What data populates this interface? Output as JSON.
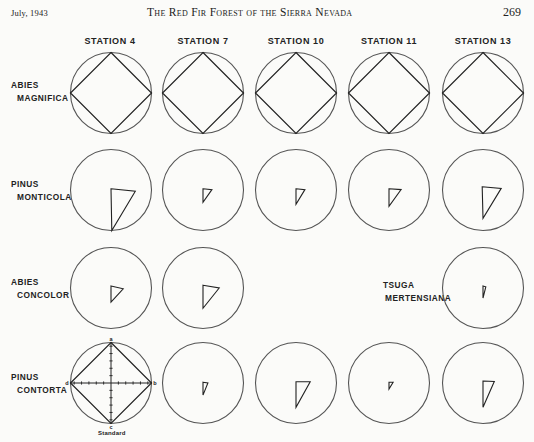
{
  "running_head": {
    "date": "July, 1943",
    "title": "The Red Fir Forest of the Sierra Nevada",
    "page_number": "269"
  },
  "figure": {
    "stations": [
      "STATION 4",
      "STATION 7",
      "STATION 10",
      "STATION 11",
      "STATION 13"
    ],
    "species": [
      {
        "line1": "ABIES",
        "line2": "MAGNIFICA"
      },
      {
        "line1": "PINUS",
        "line2": "MONTICOLA"
      },
      {
        "line1": "ABIES",
        "line2": "CONCOLOR"
      },
      {
        "line1": "PINUS",
        "line2": "CONTORTA"
      }
    ],
    "inline_species": {
      "line1": "TSUGA",
      "line2": "MERTENSIANA"
    },
    "standard_caption": "Standard",
    "axis_labels": {
      "a": "a",
      "b": "b",
      "c": "c",
      "d": "d"
    }
  },
  "chart_data": {
    "type": "polar-diagram-grid",
    "rows": [
      "Abies magnifica",
      "Pinus monticola",
      "Abies concolor",
      "Pinus contorta"
    ],
    "columns": [
      "Station 4",
      "Station 7",
      "Station 10",
      "Station 11",
      "Station 13"
    ],
    "cells": [
      [
        {
          "a": 1.0,
          "b": 1.0,
          "c": 1.0,
          "d": 1.0
        },
        {
          "a": 1.0,
          "b": 1.0,
          "c": 1.0,
          "d": 1.0
        },
        {
          "a": 1.0,
          "b": 1.0,
          "c": 1.0,
          "d": 1.0
        },
        {
          "a": 1.0,
          "b": 1.0,
          "c": 1.0,
          "d": 1.0
        },
        {
          "a": 1.0,
          "b": 1.0,
          "c": 1.0,
          "d": 1.0
        }
      ],
      [
        {
          "a": 0.02,
          "b": 0.6,
          "c": 1.0,
          "d": 0.0,
          "shape": [
            [
              0.0,
              -0.03
            ],
            [
              0.6,
              0.03
            ],
            [
              0.02,
              1.0
            ]
          ]
        },
        {
          "a": 0.0,
          "b": 0.22,
          "c": 0.3,
          "d": 0.0,
          "shape": [
            [
              0.0,
              -0.03
            ],
            [
              0.22,
              -0.01
            ],
            [
              0.0,
              0.3
            ]
          ]
        },
        {
          "a": 0.0,
          "b": 0.22,
          "c": 0.35,
          "d": 0.0,
          "shape": [
            [
              0.0,
              -0.03
            ],
            [
              0.22,
              -0.01
            ],
            [
              0.0,
              0.35
            ]
          ]
        },
        {
          "a": 0.0,
          "b": 0.3,
          "c": 0.4,
          "d": 0.0,
          "shape": [
            [
              0.0,
              -0.03
            ],
            [
              0.3,
              -0.01
            ],
            [
              0.0,
              0.4
            ]
          ]
        },
        {
          "a": 0.08,
          "b": 0.45,
          "c": 0.7,
          "d": 0.0,
          "shape": [
            [
              -0.02,
              -0.08
            ],
            [
              0.45,
              -0.04
            ],
            [
              0.0,
              0.7
            ]
          ]
        }
      ],
      [
        {
          "a": 0.05,
          "b": 0.3,
          "c": 0.35,
          "d": 0.0,
          "shape": [
            [
              0.0,
              -0.05
            ],
            [
              0.3,
              0.02
            ],
            [
              0.0,
              0.35
            ]
          ]
        },
        {
          "a": 0.07,
          "b": 0.4,
          "c": 0.5,
          "d": 0.0,
          "shape": [
            [
              0.0,
              -0.07
            ],
            [
              0.4,
              0.0
            ],
            [
              0.0,
              0.5
            ]
          ]
        },
        null,
        null,
        {
          "a": 0.05,
          "b": 0.07,
          "c": 0.25,
          "d": 0.0,
          "shape": [
            [
              0.0,
              -0.05
            ],
            [
              0.07,
              -0.03
            ],
            [
              0.0,
              0.25
            ]
          ]
        }
      ],
      [
        {
          "a": 1.0,
          "b": 1.0,
          "c": 1.0,
          "d": 1.0,
          "standard": true
        },
        {
          "a": 0.0,
          "b": 0.12,
          "c": 0.3,
          "d": 0.0,
          "shape": [
            [
              0.0,
              -0.02
            ],
            [
              0.12,
              0.0
            ],
            [
              0.0,
              0.3
            ]
          ]
        },
        {
          "a": 0.0,
          "b": 0.35,
          "c": 0.6,
          "d": 0.0,
          "shape": [
            [
              0.0,
              -0.03
            ],
            [
              0.35,
              -0.03
            ],
            [
              0.0,
              0.6
            ]
          ]
        },
        {
          "a": 0.0,
          "b": 0.1,
          "c": 0.15,
          "d": 0.0,
          "shape": [
            [
              0.0,
              -0.02
            ],
            [
              0.1,
              -0.02
            ],
            [
              0.0,
              0.15
            ]
          ]
        },
        {
          "a": 0.0,
          "b": 0.28,
          "c": 0.6,
          "d": 0.0,
          "shape": [
            [
              0.0,
              -0.05
            ],
            [
              0.28,
              -0.04
            ],
            [
              0.0,
              0.6
            ]
          ]
        }
      ]
    ]
  }
}
